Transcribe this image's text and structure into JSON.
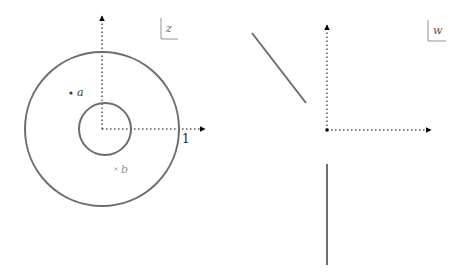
{
  "left_panel": {
    "plane_label": "z",
    "unit_label": "1",
    "points": [
      {
        "name": "a",
        "label": "a",
        "marker": "dot"
      },
      {
        "name": "b",
        "label": "b",
        "marker": "cross"
      }
    ],
    "curves": {
      "outer_circle_radius": 1,
      "inner_circle_radius": 0.33
    }
  },
  "right_panel": {
    "plane_label": "w"
  },
  "colors": {
    "curve": "#6e6e6e",
    "axis": "#000000",
    "point_a": "#333333",
    "point_b": "#a0a0a0",
    "label_box": "#888888"
  }
}
